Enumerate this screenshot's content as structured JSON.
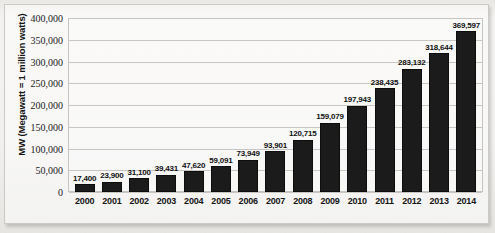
{
  "chart_data": {
    "type": "bar",
    "title": "",
    "subtitle": "",
    "xlabel": "",
    "ylabel": "MW (Megawatt = 1 million watts)",
    "categories": [
      "2000",
      "2001",
      "2002",
      "2003",
      "2004",
      "2005",
      "2006",
      "2007",
      "2008",
      "2009",
      "2010",
      "2011",
      "2012",
      "2013",
      "2014"
    ],
    "values": [
      17400,
      23900,
      31100,
      39431,
      47620,
      59091,
      73949,
      93901,
      120715,
      159079,
      197943,
      238435,
      283132,
      318644,
      369597
    ],
    "value_labels": [
      "17,400",
      "23,900",
      "31,100",
      "39,431",
      "47,620",
      "59,091",
      "73,949",
      "93,901",
      "120,715",
      "159,079",
      "197,943",
      "238,435",
      "283,132",
      "318,644",
      "369,597"
    ],
    "ylim": [
      0,
      400000
    ],
    "ytick_values": [
      0,
      50000,
      100000,
      150000,
      200000,
      250000,
      300000,
      350000,
      400000
    ],
    "ytick_labels": [
      "0",
      "50,000",
      "100,000",
      "150,000",
      "200,000",
      "250,000",
      "300,000",
      "350,000",
      "400,000"
    ],
    "grid": true,
    "legend": false,
    "legend_position": "none",
    "series_color": "#1b1b1b",
    "gridline_color": "#cbc8c4",
    "background_color": "#f2f1ef",
    "data_labels_shown": true
  }
}
